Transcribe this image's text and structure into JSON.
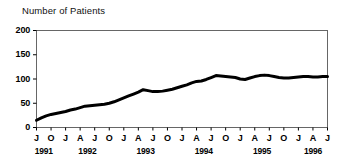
{
  "chart_data": {
    "type": "line",
    "title": "Number of Patients",
    "xlabel": "",
    "ylabel": "Number of Patients",
    "ylim": [
      0,
      200
    ],
    "yticks": [
      0,
      50,
      100,
      150,
      200
    ],
    "grid": false,
    "legend": null,
    "line_color": "#000000",
    "frame_color": "#555555",
    "x_axis_years": [
      {
        "year": "1991",
        "months": [
          "J",
          "O"
        ]
      },
      {
        "year": "1992",
        "months": [
          "J",
          "A",
          "J",
          "O"
        ]
      },
      {
        "year": "1993",
        "months": [
          "J",
          "A",
          "J",
          "O"
        ]
      },
      {
        "year": "1994",
        "months": [
          "J",
          "A",
          "J",
          "O"
        ]
      },
      {
        "year": "1995",
        "months": [
          "J",
          "A",
          "J",
          "O"
        ]
      },
      {
        "year": "1996",
        "months": [
          "J",
          "A",
          "J"
        ]
      }
    ],
    "x": [
      "1991-07",
      "1991-08",
      "1991-09",
      "1991-10",
      "1991-11",
      "1991-12",
      "1992-01",
      "1992-02",
      "1992-03",
      "1992-04",
      "1992-05",
      "1992-06",
      "1992-07",
      "1992-08",
      "1992-09",
      "1992-10",
      "1992-11",
      "1992-12",
      "1993-01",
      "1993-02",
      "1993-03",
      "1993-04",
      "1993-05",
      "1993-06",
      "1993-07",
      "1993-08",
      "1993-09",
      "1993-10",
      "1993-11",
      "1993-12",
      "1994-01",
      "1994-02",
      "1994-03",
      "1994-04",
      "1994-05",
      "1994-06",
      "1994-07",
      "1994-08",
      "1994-09",
      "1994-10",
      "1994-11",
      "1994-12",
      "1995-01",
      "1995-02",
      "1995-03",
      "1995-04",
      "1995-05",
      "1995-06",
      "1995-07",
      "1995-08",
      "1995-09",
      "1995-10",
      "1995-11",
      "1995-12",
      "1996-01",
      "1996-02",
      "1996-03",
      "1996-04",
      "1996-05",
      "1996-06",
      "1996-07"
    ],
    "values": [
      15,
      20,
      24,
      27,
      29,
      31,
      33,
      36,
      38,
      41,
      44,
      45,
      46,
      47,
      48,
      50,
      53,
      57,
      61,
      65,
      69,
      73,
      78,
      76,
      74,
      74,
      75,
      77,
      79,
      82,
      85,
      88,
      92,
      95,
      96,
      99,
      103,
      107,
      106,
      105,
      104,
      103,
      100,
      99,
      102,
      105,
      107,
      108,
      107,
      105,
      103,
      102,
      102,
      103,
      104,
      105,
      105,
      104,
      104,
      105,
      105
    ]
  }
}
